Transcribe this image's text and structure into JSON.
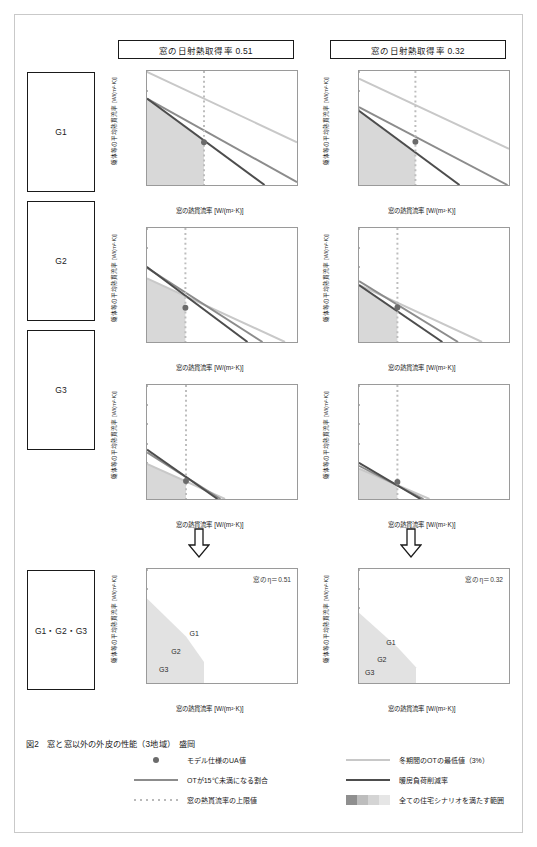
{
  "figure": {
    "caption": "図2　窓と窓以外の外皮の性能（3地域）　盛岡",
    "columns": [
      {
        "id": "col-051",
        "header": "窓の日射熱取得率  0.51",
        "eta": 0.51,
        "eta_note": "窓のη＝0.51"
      },
      {
        "id": "col-032",
        "header": "窓の日射熱取得率  0.32",
        "eta": 0.32,
        "eta_note": "窓のη＝0.32"
      }
    ],
    "row_labels": [
      "G1",
      "G2",
      "G3",
      "G1・G2・G3"
    ],
    "axis": {
      "xlabel": "窓の熱貫流率 [W/(m²·K)]",
      "ylabel": "躯体等の平均熱貫流率 [W/(m²·K)]",
      "xticks": [
        "0",
        "1",
        "2",
        "3",
        "4",
        "5"
      ],
      "yticks": [
        "0",
        "0.1",
        "0.2",
        "0.3",
        "0.4",
        "0.5",
        "0.6"
      ],
      "xlim": [
        0,
        5
      ],
      "ylim": [
        0,
        0.6
      ]
    },
    "region_labels": [
      "G1",
      "G2",
      "G3"
    ]
  },
  "colors": {
    "ot_min_line": "#c8c8c8",
    "ot_under15_line": "#8c8c8c",
    "heating_reduction_line": "#4d4d4d",
    "window_u_limit": "#bdbdbd",
    "model_marker": "#6b6b6b",
    "band_g1": "#e2e2e2",
    "band_g2": "#bdbdbd",
    "band_g3": "#8f8f8f",
    "shaded_region": "#d8d8d8",
    "frame": "#1a1a1a"
  },
  "legend": {
    "left_items": [
      {
        "name": "model-ua-marker",
        "symbol": "filled-circle",
        "label": "モデル仕様のUA値"
      },
      {
        "name": "ot-under-15-line",
        "symbol": "solid-line-mid",
        "label": "OTが15℃未満になる割合"
      },
      {
        "name": "window-u-limit-line",
        "symbol": "dotted-line",
        "label": "窓の熱貫流率の上限値"
      }
    ],
    "right_items": [
      {
        "name": "winter-ot-min-line",
        "symbol": "solid-line-light",
        "label": "冬期間のOTの最低値（3%）"
      },
      {
        "name": "heating-load-reduction-line",
        "symbol": "solid-line-dark",
        "label": "暖房負荷削減率"
      },
      {
        "name": "all-scenario-band",
        "symbol": "gradient-bands",
        "label": "全ての住宅シナリオを満たす範囲"
      }
    ]
  },
  "chart_data": [
    {
      "id": "g1-eta051",
      "type": "line",
      "title": "G1 / η=0.51",
      "xlabel": "窓の熱貫流率 [W/(m²·K)]",
      "ylabel": "躯体等の平均熱貫流率 [W/(m²·K)]",
      "xlim": [
        0,
        5
      ],
      "ylim": [
        0,
        0.6
      ],
      "grid": false,
      "series": [
        {
          "name": "冬期間のOTの最低値（3%）",
          "color": "#c8c8c8",
          "points": [
            [
              0,
              0.595
            ],
            [
              5,
              0.225
            ]
          ]
        },
        {
          "name": "OTが15℃未満になる割合",
          "color": "#8c8c8c",
          "points": [
            [
              0,
              0.455
            ],
            [
              5,
              0.015
            ]
          ]
        },
        {
          "name": "暖房負荷削減率",
          "color": "#4d4d4d",
          "points": [
            [
              0,
              0.455
            ],
            [
              3.92,
              0.0
            ]
          ]
        }
      ],
      "window_u_limit": 1.9,
      "model_marker": [
        1.9,
        0.225
      ],
      "shaded_region": {
        "x": [
          0,
          1.9
        ],
        "ymax_at_x0": 0.455,
        "ymax_at_xlim": 0.225
      }
    },
    {
      "id": "g1-eta032",
      "type": "line",
      "title": "G1 / η=0.32",
      "xlim": [
        0,
        5
      ],
      "ylim": [
        0,
        0.6
      ],
      "grid": false,
      "series": [
        {
          "name": "冬期間のOTの最低値（3%）",
          "color": "#c8c8c8",
          "points": [
            [
              0,
              0.56
            ],
            [
              5,
              0.19
            ]
          ]
        },
        {
          "name": "OTが15℃未満になる割合",
          "color": "#8c8c8c",
          "points": [
            [
              0,
              0.41
            ],
            [
              4.95,
              0.0
            ]
          ]
        },
        {
          "name": "暖房負荷削減率",
          "color": "#4d4d4d",
          "points": [
            [
              0,
              0.39
            ],
            [
              3.35,
              0.0
            ]
          ]
        }
      ],
      "window_u_limit": 1.88,
      "model_marker": [
        1.88,
        0.228
      ],
      "shaded_region": {
        "x": [
          0,
          1.88
        ],
        "ymax_at_x0": 0.39,
        "ymax_at_xlim": 0.175
      }
    },
    {
      "id": "g2-eta051",
      "type": "line",
      "title": "G2 / η=0.51",
      "xlim": [
        0,
        5
      ],
      "ylim": [
        0,
        0.6
      ],
      "grid": false,
      "series": [
        {
          "name": "冬期間のOTの最低値（3%）",
          "color": "#c8c8c8",
          "points": [
            [
              0,
              0.335
            ],
            [
              4.6,
              0.0
            ]
          ]
        },
        {
          "name": "OTが15℃未満になる割合",
          "color": "#8c8c8c",
          "points": [
            [
              0,
              0.39
            ],
            [
              3.85,
              0.0
            ]
          ]
        },
        {
          "name": "暖房負荷削減率",
          "color": "#4d4d4d",
          "points": [
            [
              0,
              0.395
            ],
            [
              3.35,
              0.0
            ]
          ]
        }
      ],
      "window_u_limit": 1.28,
      "model_marker": [
        1.28,
        0.18
      ],
      "shaded_region": {
        "x": [
          0,
          1.28
        ],
        "ymax_at_x0": 0.335,
        "ymax_at_xlim": 0.245
      }
    },
    {
      "id": "g2-eta032",
      "type": "line",
      "title": "G2 / η=0.32",
      "xlim": [
        0,
        5
      ],
      "ylim": [
        0,
        0.6
      ],
      "grid": false,
      "series": [
        {
          "name": "冬期間のOTの最低値（3%）",
          "color": "#c8c8c8",
          "points": [
            [
              0,
              0.3
            ],
            [
              4.1,
              0.0
            ]
          ]
        },
        {
          "name": "OTが15℃未満になる割合",
          "color": "#8c8c8c",
          "points": [
            [
              0,
              0.32
            ],
            [
              3.3,
              0.0
            ]
          ]
        },
        {
          "name": "暖房負荷削減率",
          "color": "#4d4d4d",
          "points": [
            [
              0,
              0.3
            ],
            [
              2.78,
              0.0
            ]
          ]
        }
      ],
      "window_u_limit": 1.28,
      "model_marker": [
        1.28,
        0.182
      ],
      "shaded_region": {
        "x": [
          0,
          1.28
        ],
        "ymax_at_x0": 0.3,
        "ymax_at_xlim": 0.185
      }
    },
    {
      "id": "g3-eta051",
      "type": "line",
      "title": "G3 / η=0.51",
      "xlim": [
        0,
        5
      ],
      "ylim": [
        0,
        0.6
      ],
      "grid": false,
      "series": [
        {
          "name": "冬期間のOTの最低値（3%）",
          "color": "#c8c8c8",
          "points": [
            [
              0,
              0.185
            ],
            [
              2.6,
              0.0
            ]
          ]
        },
        {
          "name": "OTが15℃未満になる割合",
          "color": "#8c8c8c",
          "points": [
            [
              0,
              0.245
            ],
            [
              2.45,
              0.0
            ]
          ]
        },
        {
          "name": "暖房負荷削減率",
          "color": "#4d4d4d",
          "points": [
            [
              0,
              0.26
            ],
            [
              2.35,
              0.0
            ]
          ]
        }
      ],
      "window_u_limit": 1.3,
      "model_marker": [
        1.3,
        0.095
      ],
      "shaded_region": {
        "x": [
          0,
          1.3
        ],
        "ymax_at_x0": 0.185,
        "ymax_at_xlim": 0.095
      }
    },
    {
      "id": "g3-eta032",
      "type": "line",
      "title": "G3 / η=0.32",
      "xlim": [
        0,
        5
      ],
      "ylim": [
        0,
        0.6
      ],
      "grid": false,
      "series": [
        {
          "name": "冬期間のOTの最低値（3%）",
          "color": "#c8c8c8",
          "points": [
            [
              0,
              0.16
            ],
            [
              2.35,
              0.0
            ]
          ]
        },
        {
          "name": "OTが15℃未満になる割合",
          "color": "#8c8c8c",
          "points": [
            [
              0,
              0.175
            ],
            [
              2.15,
              0.0
            ]
          ]
        },
        {
          "name": "暖房負荷削減率",
          "color": "#4d4d4d",
          "points": [
            [
              0,
              0.19
            ],
            [
              2.05,
              0.0
            ]
          ]
        }
      ],
      "window_u_limit": 1.28,
      "model_marker": [
        1.28,
        0.09
      ],
      "shaded_region": {
        "x": [
          0,
          1.28
        ],
        "ymax_at_x0": 0.16,
        "ymax_at_xlim": 0.088
      }
    },
    {
      "id": "summary-eta051",
      "type": "area",
      "title": "G1・G2・G3 / η=0.51",
      "xlim": [
        0,
        5
      ],
      "ylim": [
        0,
        0.6
      ],
      "grid": false,
      "annotation": "窓のη＝0.51",
      "bands": [
        {
          "name": "G1",
          "color": "#e2e2e2",
          "y_at_x0": 0.445,
          "y_at_kink": 0.245,
          "x_kink": 1.3,
          "x_end": 1.9,
          "label_at": [
            1.55,
            0.27
          ]
        },
        {
          "name": "G2",
          "color": "#bdbdbd",
          "y_at_x0": 0.335,
          "y_at_kink": 0.2,
          "x_kink": 1.0,
          "x_end": 1.3,
          "label_at": [
            0.95,
            0.175
          ]
        },
        {
          "name": "G3",
          "color": "#8f8f8f",
          "y_at_x0": 0.245,
          "y_at_kink": 0.1,
          "x_kink": 0.9,
          "x_end": 1.3,
          "label_at": [
            0.55,
            0.085
          ]
        }
      ]
    },
    {
      "id": "summary-eta032",
      "type": "area",
      "title": "G1・G2・G3 / η=0.32",
      "xlim": [
        0,
        5
      ],
      "ylim": [
        0,
        0.6
      ],
      "grid": false,
      "annotation": "窓のη＝0.32",
      "bands": [
        {
          "name": "G1",
          "color": "#e2e2e2",
          "y_at_x0": 0.37,
          "y_at_kink": 0.185,
          "x_kink": 1.3,
          "x_end": 1.9,
          "label_at": [
            1.05,
            0.225
          ]
        },
        {
          "name": "G2",
          "color": "#bdbdbd",
          "y_at_x0": 0.295,
          "y_at_kink": 0.155,
          "x_kink": 1.0,
          "x_end": 1.3,
          "label_at": [
            0.75,
            0.135
          ]
        },
        {
          "name": "G3",
          "color": "#8f8f8f",
          "y_at_x0": 0.175,
          "y_at_kink": 0.075,
          "x_kink": 0.75,
          "x_end": 1.05,
          "label_at": [
            0.35,
            0.065
          ]
        }
      ]
    }
  ]
}
